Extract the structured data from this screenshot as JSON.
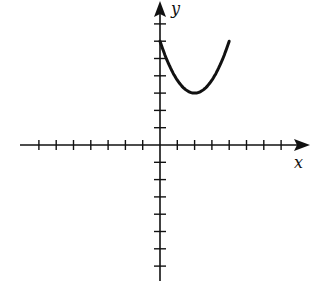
{
  "chart_data": {
    "type": "line",
    "title": "",
    "xlabel": "x",
    "ylabel": "y",
    "xlim": [
      -7,
      8
    ],
    "ylim": [
      -8,
      8
    ],
    "grid": false,
    "x_ticks_left": 7,
    "x_ticks_right": 7,
    "y_ticks_up": 7,
    "y_ticks_down": 7,
    "series": [
      {
        "name": "parabola",
        "description": "upward-opening parabola, vertex (2,3), passing through (0,6) and (4,6)",
        "x": [
          0,
          0.5,
          1,
          1.5,
          2,
          2.5,
          3,
          3.5,
          4
        ],
        "values": [
          6,
          4.69,
          3.75,
          3.19,
          3,
          3.19,
          3.75,
          4.69,
          6
        ]
      }
    ]
  },
  "labels": {
    "x_axis": "x",
    "y_axis": "y"
  },
  "colors": {
    "ink": "#111111",
    "background": "#ffffff"
  }
}
